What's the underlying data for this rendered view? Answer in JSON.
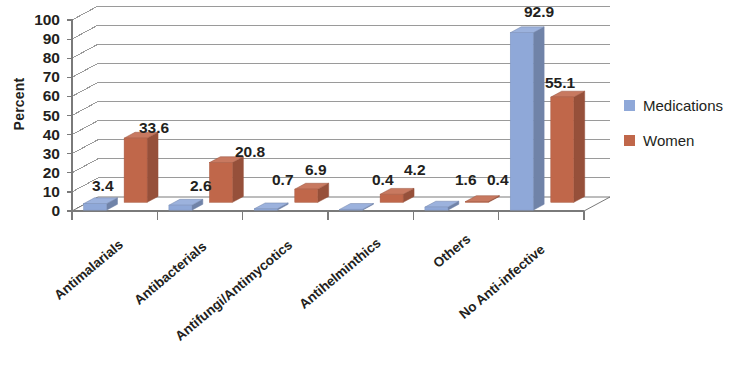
{
  "chart_data": {
    "type": "bar",
    "title": "",
    "subtitle": "",
    "xlabel": "",
    "ylabel": "Percent",
    "ylim": [
      0,
      100
    ],
    "yticks": [
      100,
      90,
      80,
      70,
      60,
      50,
      40,
      30,
      20,
      10,
      0
    ],
    "grid": true,
    "style": "3d-clustered-column",
    "legend_position": "right",
    "categories": [
      "Antimalarials",
      "Antibacterials",
      "Antifungi/Antimycotics",
      "Antihelminthics",
      "Others",
      "No Anti-infective"
    ],
    "series": [
      {
        "name": "Medications",
        "color": "#8fa8d8",
        "values": [
          3.4,
          2.6,
          0.7,
          0.4,
          1.6,
          92.9
        ],
        "labels": [
          "3.4",
          "2.6",
          "0.7",
          "0.4",
          "1.6",
          "92.9"
        ]
      },
      {
        "name": "Women",
        "color": "#c0674a",
        "values": [
          33.6,
          20.8,
          6.9,
          4.2,
          0.4,
          55.1
        ],
        "labels": [
          "33.6",
          "20.8",
          "6.9",
          "4.2",
          "0.4",
          "55.1"
        ]
      }
    ]
  },
  "colors": {
    "series_medications": "#8fa8d8",
    "series_women": "#c0674a",
    "gridline": "#9a9a9a",
    "axis": "#7a7a7a",
    "text": "#231f20",
    "background": "#ffffff"
  },
  "legend": {
    "items": [
      {
        "label": "Medications",
        "color": "#8fa8d8"
      },
      {
        "label": "Women",
        "color": "#c0674a"
      }
    ]
  },
  "axis": {
    "y_title": "Percent",
    "y_ticks": [
      "100",
      "90",
      "80",
      "70",
      "60",
      "50",
      "40",
      "30",
      "20",
      "10",
      "0"
    ]
  }
}
